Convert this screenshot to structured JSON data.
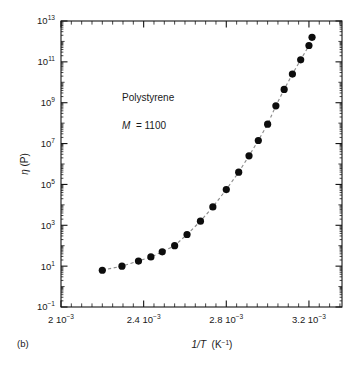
{
  "panel": {
    "label": "(b)"
  },
  "annotations": {
    "material": "Polystyrene",
    "molecular_weight_symbol": "M",
    "molecular_weight_text": "M  =  1100",
    "molecular_weight_value": "=  1100"
  },
  "axes": {
    "x": {
      "title_main": "1/T",
      "title_units": "(K",
      "title_units_sup": "−1",
      "title_units_close": ")",
      "title_full": "1/T  (K⁻¹)",
      "tick_labels": [
        "2 10",
        "2.4 10",
        "2.8 10",
        "3.2 10"
      ],
      "tick_exponent": "−3",
      "tick_values": [
        0.002,
        0.0024,
        0.0028,
        0.0032
      ],
      "range": [
        0.002,
        0.00336
      ]
    },
    "y": {
      "title_symbol": "η",
      "title_units": "(P)",
      "title_full": "η (P)",
      "tick_labels": [
        "10",
        "10",
        "10",
        "10",
        "10",
        "10",
        "10",
        "10"
      ],
      "tick_exponents": [
        "−1",
        "1",
        "3",
        "5",
        "7",
        "9",
        "11",
        "13"
      ],
      "tick_values": [
        -1,
        1,
        3,
        5,
        7,
        9,
        11,
        13
      ],
      "range": [
        -1,
        13
      ]
    }
  },
  "colors": {
    "axis": "#141414",
    "point": "#0d0d0d",
    "line": "#8c8c8c",
    "background": "#ffffff"
  },
  "chart_data": {
    "type": "scatter",
    "title": "",
    "subtitle": "",
    "xlabel": "1/T  (K⁻¹)",
    "ylabel": "η (P)",
    "xlim": [
      0.002,
      0.00336
    ],
    "ylim": [
      -1,
      13
    ],
    "y_scale": "log10",
    "grid": false,
    "legend": null,
    "annotations": [
      "Polystyrene",
      "M = 1100",
      "(b)"
    ],
    "series": [
      {
        "name": "Polystyrene M = 1100 viscosity",
        "marker": "filled-circle",
        "connector": "dashed",
        "x": [
          0.0022,
          0.002295,
          0.002375,
          0.002435,
          0.00249,
          0.00255,
          0.00261,
          0.002675,
          0.002735,
          0.0028,
          0.00286,
          0.00291,
          0.002955,
          0.003,
          0.00304,
          0.00308,
          0.00312,
          0.00316,
          0.0032,
          0.003215
        ],
        "y_log10": [
          0.8,
          1.0,
          1.25,
          1.45,
          1.7,
          2.0,
          2.55,
          3.2,
          3.9,
          4.75,
          5.6,
          6.4,
          7.15,
          7.95,
          8.85,
          9.65,
          10.4,
          11.1,
          11.8,
          12.2
        ],
        "y": [
          6.3,
          10,
          18,
          28,
          50,
          100,
          355,
          1580,
          7900,
          56000,
          400000,
          2500000.0,
          14000000.0,
          89000000.0,
          710000000.0,
          4500000000.0,
          25000000000.0,
          130000000000.0,
          630000000000.0,
          1600000000000.0
        ]
      }
    ]
  }
}
